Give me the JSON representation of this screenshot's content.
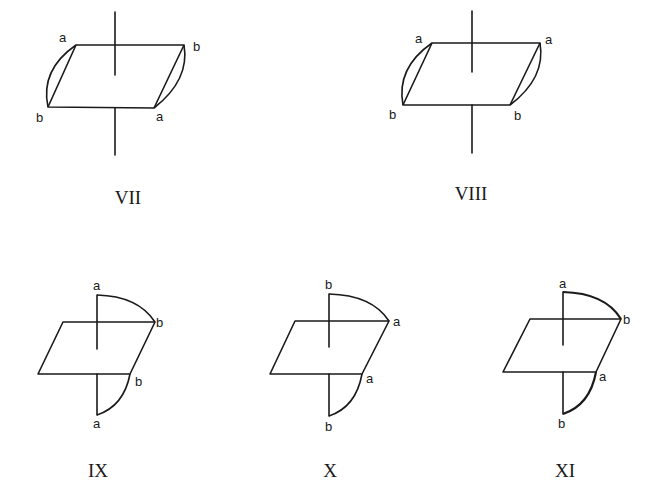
{
  "figures": [
    {
      "id": "VII",
      "caption": "VII",
      "labels": {
        "top_left": "a",
        "top_right": "b",
        "bottom_left": "b",
        "bottom_right": "a"
      }
    },
    {
      "id": "VIII",
      "caption": "VIII",
      "labels": {
        "top_left": "a",
        "top_right": "a",
        "bottom_left": "b",
        "bottom_right": "b"
      }
    },
    {
      "id": "IX",
      "caption": "IX",
      "labels": {
        "axis_top": "a",
        "top_right": "b",
        "bottom_right": "b",
        "axis_bottom": "a"
      }
    },
    {
      "id": "X",
      "caption": "X",
      "labels": {
        "axis_top": "b",
        "top_right": "a",
        "bottom_right": "a",
        "axis_bottom": "b"
      }
    },
    {
      "id": "XI",
      "caption": "XI",
      "labels": {
        "axis_top": "a",
        "top_right": "b",
        "bottom_right": "a",
        "axis_bottom": "b"
      }
    }
  ]
}
